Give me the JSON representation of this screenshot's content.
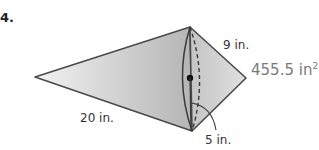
{
  "problem": {
    "number": "4."
  },
  "figure": {
    "labels": {
      "left_slant": "20 in.",
      "right_slant": "9 in.",
      "radius": "5 in.",
      "surface_area_value": "455.5 in",
      "surface_area_exponent": "2"
    },
    "colors": {
      "fill_light": "#e8e8e8",
      "fill_dark": "#b8b8b8",
      "stroke": "#4a4a4a",
      "area_text": "#7a7a7a"
    }
  }
}
